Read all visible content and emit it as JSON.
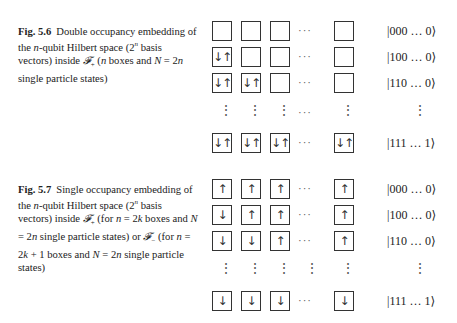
{
  "figures": [
    {
      "label": "Fig. 5.6",
      "caption_html": "Double occupancy embedding of the <i>n</i>-qubit Hilbert space (2<sup style=\"font-size:7px\"><i>n</i></sup> basis vectors) inside <i>𝓕</i><sub style=\"font-size:7px\">+</sub> (<i>n</i> boxes and <i>N</i> = 2<i>n</i> single particle states)",
      "rows": [
        {
          "boxes": [
            "",
            "",
            "",
            "",
            ""
          ],
          "ket": "|000 … 0⟩"
        },
        {
          "boxes": [
            "↓↑",
            "",
            "",
            "",
            ""
          ],
          "ket": "|100 … 0⟩"
        },
        {
          "boxes": [
            "↓↑",
            "↓↑",
            "",
            "",
            ""
          ],
          "ket": "|110 … 0⟩"
        },
        {
          "boxes": [
            "↓↑",
            "↓↑",
            "↓↑",
            "",
            "↓↑"
          ],
          "ket": "|111 … 1⟩"
        }
      ]
    },
    {
      "label": "Fig. 5.7",
      "caption_html": "Single occupancy embedding of the <i>n</i>-qubit Hilbert space (2<sup style=\"font-size:7px\"><i>n</i></sup> basis vectors) inside <i>𝓕</i><sub style=\"font-size:7px\">+</sub> (for <i>n</i> = 2<i>k</i> boxes and <i>N</i> = 2<i>n</i> single particle states) or <i>𝓕</i><sub style=\"font-size:7px\">−</sub> (for <i>n</i> = 2<i>k</i> + 1 boxes and <i>N</i> = 2<i>n</i> single particle states)",
      "rows": [
        {
          "boxes": [
            "↑",
            "↑",
            "↑",
            "",
            "↑"
          ],
          "ket": "|000 … 0⟩"
        },
        {
          "boxes": [
            "↓",
            "↑",
            "↑",
            "",
            "↑"
          ],
          "ket": "|100 … 0⟩"
        },
        {
          "boxes": [
            "↓",
            "↓",
            "↑",
            "",
            "↑"
          ],
          "ket": "|110 … 0⟩"
        },
        {
          "boxes": [
            "↓",
            "↓",
            "↓",
            "",
            "↓"
          ],
          "ket": "|111 … 1⟩"
        }
      ]
    }
  ],
  "glyphs": {
    "hdots": "···",
    "vdots": "⋮"
  }
}
